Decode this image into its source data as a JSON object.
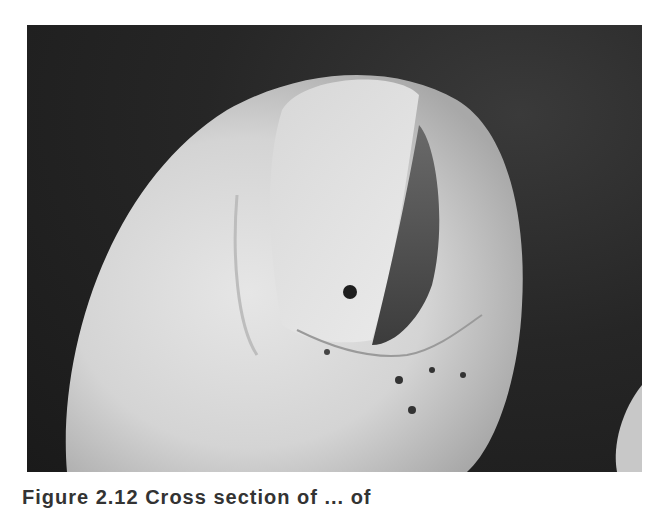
{
  "figure": {
    "image_alt": "Clinical photograph of a fingertip showing the nail plate with a dark streak along its lateral edge, scaling of periungual skin and dark debris",
    "caption": "Figure 2.12 Cross section of ... of"
  }
}
